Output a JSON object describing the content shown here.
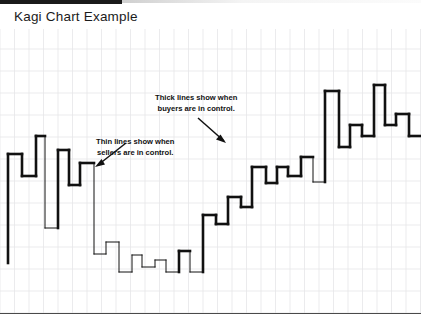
{
  "page": {
    "title": "Kagi Chart Example",
    "background_color": "#ffffff",
    "top_bar_color": "#1a1a1a"
  },
  "annotations": [
    {
      "name": "thick-lines-note",
      "line1": "Thick lines show when",
      "line2": "buyers are in control.",
      "arrow": "arrow-down-right-icon"
    },
    {
      "name": "thin-lines-note",
      "line1": "Thin lines show when",
      "line2": "sellers are in control.",
      "arrow": "arrow-down-left-icon"
    }
  ],
  "chart_data": {
    "type": "line",
    "subtype": "kagi",
    "title": "Kagi Chart Example",
    "xlabel": "",
    "ylabel": "",
    "grid": true,
    "grid_color": "#e6e6e9",
    "grid_x_spacing": 14.5,
    "grid_y_spacing": 22,
    "legend_position": "none",
    "line_color": "#111111",
    "thick_width": 2.6,
    "thin_width": 1.0,
    "xlim": [
      0,
      421
    ],
    "ylim": [
      0,
      290
    ],
    "series": [
      {
        "name": "Kagi line",
        "thick_label": "Yang (buyers in control)",
        "thin_label": "Yin (sellers in control)",
        "points": [
          {
            "x": 8,
            "y": 234,
            "w": "thick"
          },
          {
            "x": 8,
            "y": 125,
            "w": "thick"
          },
          {
            "x": 22,
            "y": 125,
            "w": "thick"
          },
          {
            "x": 22,
            "y": 147,
            "w": "thick"
          },
          {
            "x": 36,
            "y": 147,
            "w": "thick"
          },
          {
            "x": 36,
            "y": 107,
            "w": "thick"
          },
          {
            "x": 45,
            "y": 107,
            "w": "thick"
          },
          {
            "x": 45,
            "y": 199,
            "w": "thin"
          },
          {
            "x": 58,
            "y": 199,
            "w": "thin"
          },
          {
            "x": 58,
            "y": 121,
            "w": "thick"
          },
          {
            "x": 69,
            "y": 121,
            "w": "thick"
          },
          {
            "x": 69,
            "y": 156,
            "w": "thick"
          },
          {
            "x": 80,
            "y": 156,
            "w": "thick"
          },
          {
            "x": 80,
            "y": 134,
            "w": "thick"
          },
          {
            "x": 94,
            "y": 134,
            "w": "thick"
          },
          {
            "x": 94,
            "y": 225,
            "w": "thin"
          },
          {
            "x": 106,
            "y": 225,
            "w": "thin"
          },
          {
            "x": 106,
            "y": 213,
            "w": "thin"
          },
          {
            "x": 119,
            "y": 213,
            "w": "thin"
          },
          {
            "x": 119,
            "y": 243,
            "w": "thin"
          },
          {
            "x": 132,
            "y": 243,
            "w": "thin"
          },
          {
            "x": 132,
            "y": 226,
            "w": "thin"
          },
          {
            "x": 142,
            "y": 226,
            "w": "thin"
          },
          {
            "x": 142,
            "y": 238,
            "w": "thin"
          },
          {
            "x": 155,
            "y": 238,
            "w": "thin"
          },
          {
            "x": 155,
            "y": 231,
            "w": "thin"
          },
          {
            "x": 166,
            "y": 231,
            "w": "thin"
          },
          {
            "x": 166,
            "y": 243,
            "w": "thin"
          },
          {
            "x": 179,
            "y": 243,
            "w": "thin"
          },
          {
            "x": 179,
            "y": 222,
            "w": "thick"
          },
          {
            "x": 190,
            "y": 222,
            "w": "thick"
          },
          {
            "x": 190,
            "y": 243,
            "w": "thin"
          },
          {
            "x": 203,
            "y": 243,
            "w": "thin"
          },
          {
            "x": 203,
            "y": 186,
            "w": "thick"
          },
          {
            "x": 216,
            "y": 186,
            "w": "thick"
          },
          {
            "x": 216,
            "y": 195,
            "w": "thick"
          },
          {
            "x": 228,
            "y": 195,
            "w": "thick"
          },
          {
            "x": 228,
            "y": 168,
            "w": "thick"
          },
          {
            "x": 241,
            "y": 168,
            "w": "thick"
          },
          {
            "x": 241,
            "y": 178,
            "w": "thick"
          },
          {
            "x": 252,
            "y": 178,
            "w": "thick"
          },
          {
            "x": 252,
            "y": 138,
            "w": "thick"
          },
          {
            "x": 266,
            "y": 138,
            "w": "thick"
          },
          {
            "x": 266,
            "y": 154,
            "w": "thick"
          },
          {
            "x": 277,
            "y": 154,
            "w": "thick"
          },
          {
            "x": 277,
            "y": 138,
            "w": "thick"
          },
          {
            "x": 288,
            "y": 138,
            "w": "thick"
          },
          {
            "x": 288,
            "y": 147,
            "w": "thick"
          },
          {
            "x": 301,
            "y": 147,
            "w": "thick"
          },
          {
            "x": 301,
            "y": 128,
            "w": "thick"
          },
          {
            "x": 313,
            "y": 128,
            "w": "thick"
          },
          {
            "x": 313,
            "y": 153,
            "w": "thin"
          },
          {
            "x": 325,
            "y": 153,
            "w": "thin"
          },
          {
            "x": 325,
            "y": 62,
            "w": "thick"
          },
          {
            "x": 339,
            "y": 62,
            "w": "thick"
          },
          {
            "x": 339,
            "y": 118,
            "w": "thick"
          },
          {
            "x": 350,
            "y": 118,
            "w": "thick"
          },
          {
            "x": 350,
            "y": 96,
            "w": "thick"
          },
          {
            "x": 362,
            "y": 96,
            "w": "thick"
          },
          {
            "x": 362,
            "y": 107,
            "w": "thick"
          },
          {
            "x": 374,
            "y": 107,
            "w": "thick"
          },
          {
            "x": 374,
            "y": 56,
            "w": "thick"
          },
          {
            "x": 385,
            "y": 56,
            "w": "thick"
          },
          {
            "x": 385,
            "y": 96,
            "w": "thick"
          },
          {
            "x": 396,
            "y": 96,
            "w": "thick"
          },
          {
            "x": 396,
            "y": 85,
            "w": "thick"
          },
          {
            "x": 409,
            "y": 85,
            "w": "thick"
          },
          {
            "x": 409,
            "y": 107,
            "w": "thick"
          },
          {
            "x": 421,
            "y": 107,
            "w": "thick"
          }
        ]
      }
    ]
  }
}
